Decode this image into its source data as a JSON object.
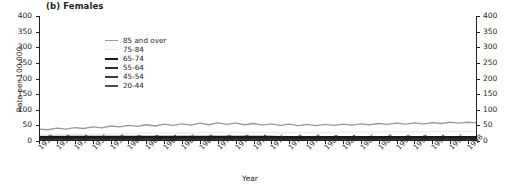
{
  "panel": {
    "title": "(b) Females"
  },
  "axes": {
    "ylabel": "Rate per 100,000",
    "xlabel": "Year",
    "y_ticks": [
      "0",
      "50",
      "100",
      "150",
      "200",
      "250",
      "300",
      "350",
      "400"
    ],
    "x_ticks": [
      "1950",
      "1952",
      "1954",
      "1956",
      "1958",
      "1960",
      "1962",
      "1964",
      "1966",
      "1968",
      "1970",
      "1972",
      "1974",
      "1976",
      "1978",
      "1978",
      "1982",
      "1984",
      "1986",
      "1988",
      "1990",
      "1992",
      "1994",
      "1996",
      "1998"
    ]
  },
  "legend": {
    "items": [
      {
        "label": "85 and over",
        "color": "#9a9a9a",
        "width": 1.3
      },
      {
        "label": "75-84",
        "color": "#ededed",
        "width": 1.3
      },
      {
        "label": "65-74",
        "color": "#1a1a1a",
        "width": 2.6
      },
      {
        "label": "55-64",
        "color": "#2e2e2e",
        "width": 2.0
      },
      {
        "label": "45-54",
        "color": "#3d3d3d",
        "width": 2.3
      },
      {
        "label": "20-44",
        "color": "#4d4d4d",
        "width": 2.0
      }
    ]
  },
  "chart_data": {
    "type": "line",
    "title": "(b) Females",
    "xlabel": "Year",
    "ylabel": "Rate per 100,000",
    "xlim": [
      1950,
      1999
    ],
    "ylim": [
      0,
      400
    ],
    "grid": false,
    "legend_position": "top-left",
    "x": [
      1950,
      1951,
      1952,
      1953,
      1954,
      1955,
      1956,
      1957,
      1958,
      1959,
      1960,
      1961,
      1962,
      1963,
      1964,
      1965,
      1966,
      1967,
      1968,
      1969,
      1970,
      1971,
      1972,
      1973,
      1974,
      1975,
      1976,
      1977,
      1978,
      1979,
      1980,
      1981,
      1982,
      1983,
      1984,
      1985,
      1986,
      1987,
      1988,
      1989,
      1990,
      1991,
      1992,
      1993,
      1994,
      1995,
      1996,
      1997,
      1998,
      1999
    ],
    "series": [
      {
        "name": "85 and over",
        "color": "#9a9a9a",
        "values": [
          38,
          36,
          41,
          38,
          43,
          40,
          45,
          42,
          48,
          45,
          50,
          47,
          52,
          48,
          54,
          50,
          55,
          51,
          57,
          52,
          58,
          53,
          57,
          52,
          56,
          51,
          55,
          50,
          54,
          49,
          53,
          49,
          53,
          50,
          54,
          51,
          55,
          52,
          56,
          53,
          57,
          54,
          58,
          55,
          59,
          56,
          60,
          57,
          60,
          58
        ]
      },
      {
        "name": "75-84",
        "color": "#ededed",
        "values": [
          20,
          19,
          21,
          20,
          22,
          21,
          23,
          22,
          24,
          23,
          25,
          24,
          26,
          25,
          27,
          26,
          27,
          26,
          28,
          27,
          28,
          27,
          28,
          27,
          28,
          27,
          28,
          27,
          28,
          27,
          28,
          27,
          28,
          27,
          29,
          28,
          29,
          28,
          30,
          29,
          30,
          29,
          30,
          29,
          31,
          30,
          31,
          30,
          31,
          30
        ]
      },
      {
        "name": "65-74",
        "color": "#1a1a1a",
        "values": [
          13,
          13,
          13,
          13,
          13,
          13,
          13,
          13,
          13,
          13,
          13,
          13,
          13,
          13,
          13,
          13,
          13,
          13,
          13,
          13,
          13,
          13,
          13,
          13,
          13,
          13,
          13,
          12,
          12,
          12,
          12,
          12,
          12,
          12,
          12,
          12,
          12,
          12,
          12,
          12,
          12,
          12,
          12,
          12,
          12,
          12,
          12,
          12,
          12,
          12
        ]
      },
      {
        "name": "55-64",
        "color": "#2e2e2e",
        "values": [
          9,
          9,
          9,
          9,
          9,
          9,
          9,
          9,
          9,
          9,
          9,
          9,
          9,
          9,
          9,
          9,
          9,
          9,
          9,
          9,
          9,
          9,
          9,
          9,
          9,
          8,
          8,
          8,
          8,
          8,
          8,
          8,
          8,
          8,
          8,
          8,
          8,
          8,
          8,
          8,
          8,
          8,
          8,
          8,
          8,
          8,
          8,
          8,
          8,
          8
        ]
      },
      {
        "name": "45-54",
        "color": "#3d3d3d",
        "values": [
          6,
          6,
          6,
          6,
          6,
          6,
          6,
          6,
          6,
          6,
          6,
          6,
          6,
          6,
          6,
          6,
          6,
          6,
          6,
          6,
          6,
          6,
          6,
          6,
          6,
          6,
          6,
          6,
          6,
          6,
          6,
          6,
          5,
          5,
          5,
          5,
          5,
          5,
          5,
          5,
          5,
          5,
          5,
          5,
          5,
          5,
          5,
          5,
          5,
          5
        ]
      },
      {
        "name": "20-44",
        "color": "#4d4d4d",
        "values": [
          3,
          3,
          3,
          3,
          3,
          3,
          3,
          3,
          3,
          3,
          3,
          3,
          3,
          3,
          3,
          3,
          3,
          3,
          3,
          3,
          3,
          3,
          3,
          3,
          3,
          3,
          3,
          3,
          3,
          3,
          3,
          3,
          3,
          3,
          3,
          3,
          3,
          3,
          3,
          3,
          3,
          3,
          3,
          3,
          3,
          3,
          3,
          3,
          3,
          3
        ]
      }
    ]
  }
}
